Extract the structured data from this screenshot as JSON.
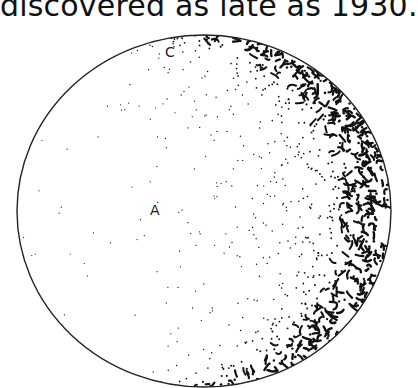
{
  "caption": "discovered as late as 1930.",
  "figure": {
    "labels": [
      {
        "id": "A",
        "text": "A"
      },
      {
        "id": "C",
        "text": "C"
      }
    ],
    "colors": {
      "ink": "#111111",
      "background": "#ffffff"
    }
  }
}
